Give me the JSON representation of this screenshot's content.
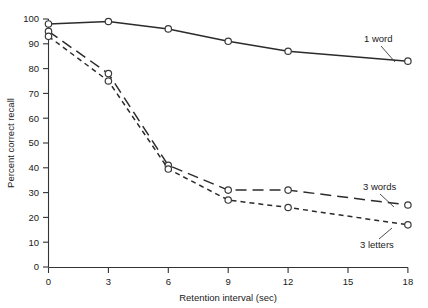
{
  "chart_data": {
    "type": "line",
    "title": "",
    "xlabel": "Retention interval  (sec)",
    "ylabel": "Percent correct recall",
    "x": [
      0,
      3,
      6,
      9,
      12,
      18
    ],
    "xlim": [
      0,
      18
    ],
    "ylim": [
      0,
      100
    ],
    "xticks": [
      "0",
      "3",
      "6",
      "9",
      "12",
      "15",
      "18"
    ],
    "xtick_values": [
      0,
      3,
      6,
      9,
      12,
      15,
      18
    ],
    "yticks": [
      "0",
      "10",
      "20",
      "30",
      "40",
      "50",
      "60",
      "70",
      "80",
      "90",
      "100"
    ],
    "ytick_values": [
      0,
      10,
      20,
      30,
      40,
      50,
      60,
      70,
      80,
      90,
      100
    ],
    "grid": false,
    "legend_position": "inline-right",
    "marker": "open-circle",
    "series": [
      {
        "name": "1 word",
        "linestyle": "solid",
        "values": [
          98,
          99,
          96,
          91,
          87,
          83
        ],
        "label_text": "1 word"
      },
      {
        "name": "3 words",
        "linestyle": "long-dash",
        "values": [
          95,
          78,
          41,
          31,
          31,
          25
        ],
        "label_text": "3 words"
      },
      {
        "name": "3 letters",
        "linestyle": "short-dash",
        "values": [
          93,
          75,
          39.5,
          27,
          24,
          17
        ],
        "label_text": "3 letters"
      }
    ],
    "colors": {
      "line": "#2b2b2b",
      "axis": "#333333",
      "text": "#1a1a1a",
      "marker_fill": "#ffffff",
      "background": "#ffffff"
    }
  }
}
